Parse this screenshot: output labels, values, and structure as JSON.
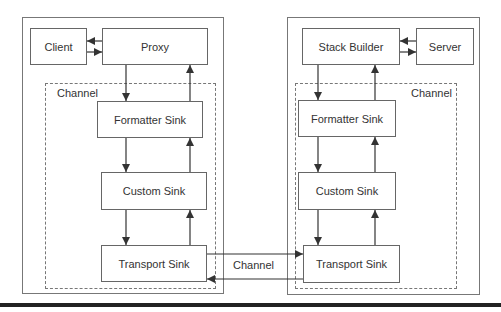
{
  "client_side": {
    "client": "Client",
    "proxy": "Proxy",
    "channel_label": "Channel",
    "formatter": "Formatter Sink",
    "custom": "Custom Sink",
    "transport": "Transport Sink"
  },
  "server_side": {
    "stack_builder": "Stack Builder",
    "server": "Server",
    "channel_label": "Channel",
    "formatter": "Formatter Sink",
    "custom": "Custom Sink",
    "transport": "Transport Sink"
  },
  "link_label": "Channel",
  "colors": {
    "line": "#333333",
    "border": "#666666",
    "dashed": "#777777",
    "bar": "#222222"
  }
}
